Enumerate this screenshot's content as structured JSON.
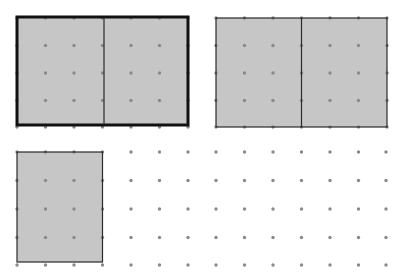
{
  "figure": {
    "width": 402,
    "height": 276,
    "background": "#ffffff",
    "colors": {
      "fill": "#c6c6c6",
      "dot": "#8a8a8a",
      "border": "#2a2a2a",
      "border_thick": "#111111"
    },
    "grid": {
      "dot_radius": 1.7,
      "upper": {
        "xs": [
          17,
          45.5,
          74,
          102.5,
          131,
          159.5,
          188,
          216,
          244.5,
          273,
          301.5,
          330,
          358.5,
          387
        ],
        "ys": [
          18,
          45.5,
          73,
          100.5,
          127
        ]
      },
      "lower": {
        "xs": [
          17,
          45.5,
          74,
          102.5,
          131,
          159.5,
          188,
          216,
          244.5,
          273,
          301.5,
          330,
          358.5,
          386
        ],
        "ys": [
          152,
          180.5,
          209,
          237.5,
          265
        ]
      }
    },
    "shapes": [
      {
        "name": "rectangle-a",
        "label": "2 by 2 rectangle pair, bold outline",
        "x": 17,
        "y": 17,
        "width": 171,
        "height": 108,
        "stroke_width": 3,
        "bold": true,
        "dividers_x": [
          104
        ]
      },
      {
        "name": "rectangle-b",
        "label": "2 by 2 rectangle pair, thin outline",
        "x": 216,
        "y": 18,
        "width": 171,
        "height": 109,
        "stroke_width": 1.2,
        "bold": false,
        "dividers_x": [
          301.5
        ]
      },
      {
        "name": "rectangle-c",
        "label": "single rectangle, thin outline",
        "x": 17,
        "y": 152,
        "width": 85.5,
        "height": 110,
        "stroke_width": 1.2,
        "bold": false,
        "dividers_x": []
      }
    ]
  }
}
